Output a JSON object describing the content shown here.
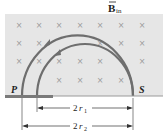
{
  "field_label": {
    "main": "B",
    "subscript": "in",
    "vector": true
  },
  "points": {
    "left": "P",
    "right": "S"
  },
  "dimensions": [
    {
      "label_coef": "2",
      "label_var": "r",
      "label_sub": "1"
    },
    {
      "label_coef": "2",
      "label_var": "r",
      "label_sub": "2"
    }
  ],
  "field_symbol": "×",
  "colors": {
    "field_region": "#e6e6e6",
    "paths": "#6e6e6e",
    "plate": "#7a7a7a",
    "marks": "#9a9a9a",
    "text": "#222222"
  }
}
